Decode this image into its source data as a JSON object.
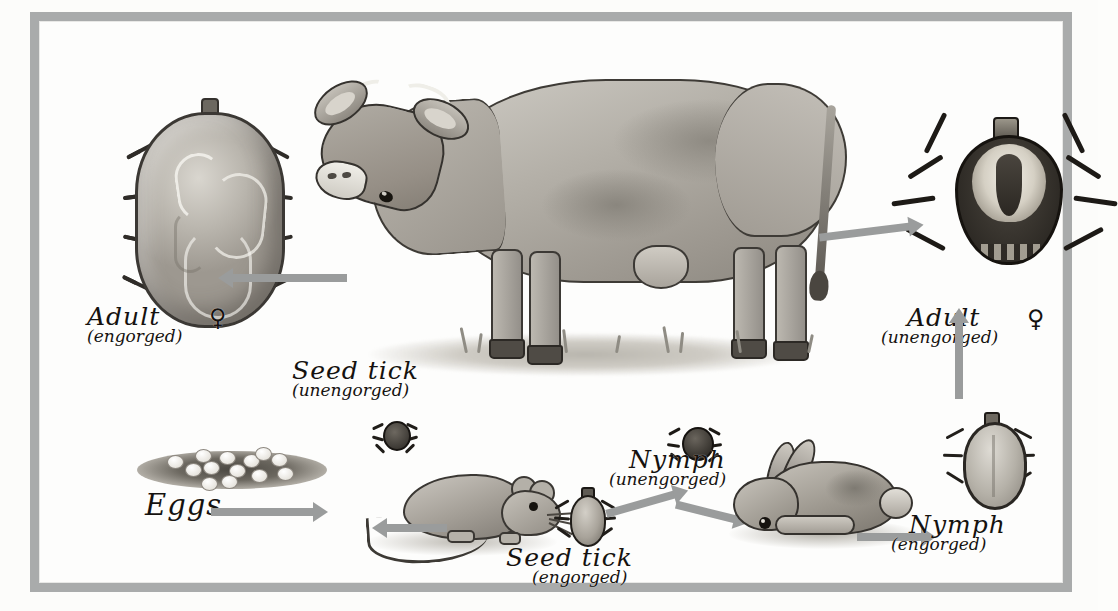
{
  "figure": {
    "kind": "illustration",
    "frame_color": "#a9abab",
    "background_color": "#fdfdfb",
    "ink_color": "#15120f",
    "arrow_color": "#9a9c9c"
  },
  "labels": {
    "adult_engorged": {
      "line1": "Adult",
      "line2": "(engorged)",
      "symbol": "♀"
    },
    "adult_unengorged": {
      "line1": "Adult",
      "line2": "(unengorged)",
      "symbol": "♀"
    },
    "seed_tick_unengorged": {
      "line1": "Seed tick",
      "line2": "(unengorged)"
    },
    "seed_tick_engorged": {
      "line1": "Seed tick",
      "line2": "(engorged)"
    },
    "nymph_unengorged": {
      "line1": "Nymph",
      "line2": "(unengorged)"
    },
    "nymph_engorged": {
      "line1": "Nymph",
      "line2": "(engorged)"
    },
    "eggs": {
      "line1": "Eggs",
      "line2": ""
    }
  },
  "organisms": [
    {
      "name": "cow",
      "role": "adult-tick-host"
    },
    {
      "name": "mouse",
      "role": "seed-tick-host"
    },
    {
      "name": "rabbit",
      "role": "nymph-host"
    }
  ],
  "arrows": [
    {
      "from": "cow",
      "to": "adult-engorged-female",
      "direction": "left"
    },
    {
      "from": "cow",
      "to": "adult-unengorged",
      "direction": "right"
    },
    {
      "from": "eggs",
      "to": "mouse",
      "direction": "right"
    },
    {
      "from": "seed-tick-engorged",
      "to": "mouse",
      "direction": "left"
    },
    {
      "from": "seed-tick-engorged",
      "to": "nymph-unengorged",
      "direction": "right"
    },
    {
      "from": "nymph-unengorged",
      "to": "rabbit",
      "direction": "right"
    },
    {
      "from": "rabbit",
      "to": "nymph-engorged",
      "direction": "right"
    },
    {
      "from": "nymph-engorged",
      "to": "adult-unengorged",
      "direction": "up"
    }
  ]
}
